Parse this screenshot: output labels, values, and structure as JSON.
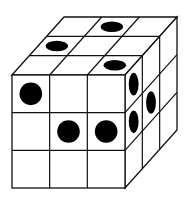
{
  "figure": {
    "type": "3x3x3 cube with dots",
    "colors": {
      "line": "#111111",
      "dot": "#000000",
      "face": "#ffffff"
    },
    "top_face_dots": [
      {
        "row": 0,
        "col": 1
      },
      {
        "row": 1,
        "col": 0
      },
      {
        "row": 2,
        "col": 2
      }
    ],
    "front_face_dots": [
      {
        "row": 0,
        "col": 0
      },
      {
        "row": 1,
        "col": 1
      },
      {
        "row": 1,
        "col": 2
      }
    ],
    "right_face_dots": [
      {
        "row": 0,
        "col": 0
      },
      {
        "row": 1,
        "col": 0
      },
      {
        "row": 1,
        "col": 1
      }
    ]
  }
}
